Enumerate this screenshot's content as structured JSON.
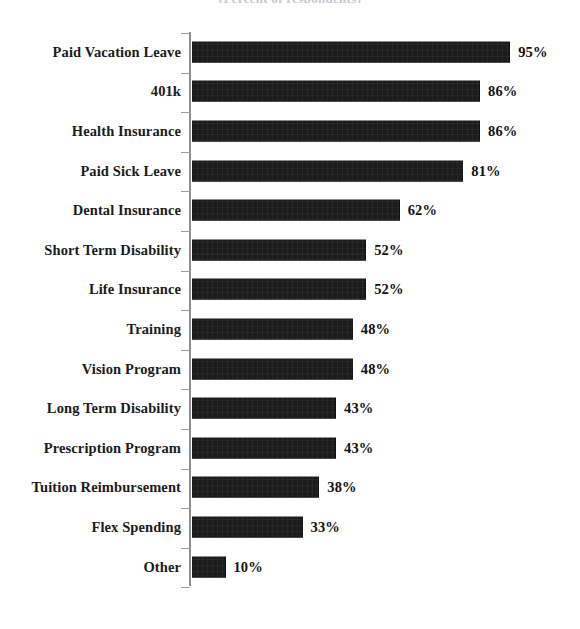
{
  "chart_data": {
    "type": "bar",
    "orientation": "horizontal",
    "title": "(Percent of respondents)",
    "xlabel": "",
    "ylabel": "",
    "xlim": [
      0,
      100
    ],
    "grid": false,
    "legend": false,
    "value_suffix": "%",
    "bar_color": "#1c1c1c",
    "axis_color": "#8e8e94",
    "text_color": "#111111",
    "categories": [
      "Paid Vacation Leave",
      "401k",
      "Health Insurance",
      "Paid Sick Leave",
      "Dental Insurance",
      "Short Term Disability",
      "Life Insurance",
      "Training",
      "Vision Program",
      "Long Term Disability",
      "Prescription Program",
      "Tuition Reimbursement",
      "Flex Spending",
      "Other"
    ],
    "values": [
      95,
      86,
      86,
      81,
      62,
      52,
      52,
      48,
      48,
      43,
      43,
      38,
      33,
      10
    ],
    "value_labels": [
      "95%",
      "86%",
      "86%",
      "81%",
      "62%",
      "52%",
      "52%",
      "48%",
      "48%",
      "43%",
      "43%",
      "38%",
      "33%",
      "10%"
    ]
  }
}
